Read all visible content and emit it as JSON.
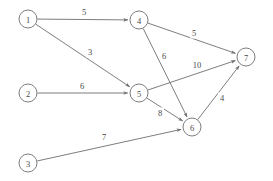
{
  "diagram": {
    "type": "directed-weighted-graph",
    "title": "",
    "style": {
      "stroke_color": "#6e6e6e",
      "text_color": "#4a4a4a",
      "background": "#ffffff",
      "node_radius": 9
    },
    "nodes": [
      {
        "id": "1",
        "label": "1",
        "x": 28,
        "y": 19
      },
      {
        "id": "2",
        "label": "2",
        "x": 28,
        "y": 93
      },
      {
        "id": "3",
        "label": "3",
        "x": 28,
        "y": 163
      },
      {
        "id": "4",
        "label": "4",
        "x": 139,
        "y": 20
      },
      {
        "id": "5",
        "label": "5",
        "x": 139,
        "y": 93
      },
      {
        "id": "6",
        "label": "6",
        "x": 192,
        "y": 127
      },
      {
        "id": "7",
        "label": "7",
        "x": 246,
        "y": 57
      }
    ],
    "edges": [
      {
        "from": "1",
        "to": "4",
        "weight": "5",
        "label_x": 84,
        "label_y": 12
      },
      {
        "from": "1",
        "to": "5",
        "weight": "3",
        "label_x": 90,
        "label_y": 52
      },
      {
        "from": "2",
        "to": "5",
        "weight": "6",
        "label_x": 82,
        "label_y": 86
      },
      {
        "from": "3",
        "to": "6",
        "weight": "7",
        "label_x": 104,
        "label_y": 137
      },
      {
        "from": "4",
        "to": "7",
        "weight": "5",
        "label_x": 194,
        "label_y": 33
      },
      {
        "from": "4",
        "to": "6",
        "weight": "6",
        "label_x": 164,
        "label_y": 56
      },
      {
        "from": "5",
        "to": "7",
        "weight": "10",
        "label_x": 197,
        "label_y": 65
      },
      {
        "from": "5",
        "to": "6",
        "weight": "8",
        "label_x": 160,
        "label_y": 113
      },
      {
        "from": "6",
        "to": "7",
        "weight": "4",
        "label_x": 222,
        "label_y": 98
      }
    ]
  }
}
